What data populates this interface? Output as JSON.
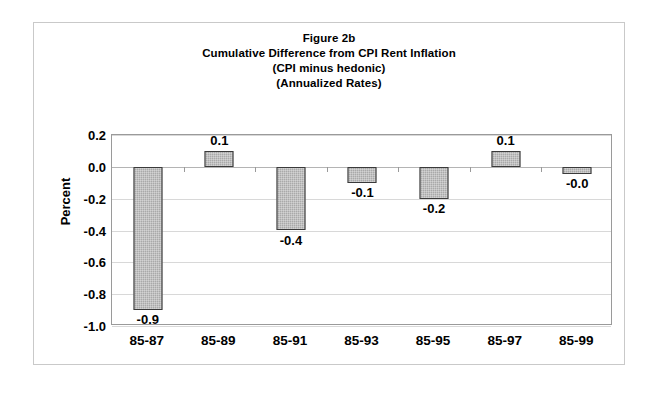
{
  "figure": {
    "title_lines": [
      "Figure 2b",
      "Cumulative Difference from CPI Rent Inflation",
      "(CPI minus hedonic)",
      "(Annualized Rates)"
    ]
  },
  "axes": {
    "y_title": "Percent",
    "y_ticks": [
      "0.2",
      "0.0",
      "-0.2",
      "-0.4",
      "-0.6",
      "-0.8",
      "-1.0"
    ]
  },
  "chart_data": {
    "type": "bar",
    "xlabel": "",
    "ylabel": "Percent",
    "ylim": [
      -1.0,
      0.2
    ],
    "ytick_step": 0.2,
    "grid": true,
    "legend": null,
    "categories": [
      "85-87",
      "85-89",
      "85-91",
      "85-93",
      "85-95",
      "85-97",
      "85-99"
    ],
    "values": [
      -0.9,
      0.1,
      -0.4,
      -0.1,
      -0.2,
      0.1,
      -0.03
    ],
    "data_labels": [
      "-0.9",
      "0.1",
      "-0.4",
      "-0.1",
      "-0.2",
      "0.1",
      "-0.0"
    ],
    "bar_color": "#a9a9a9",
    "bar_border_color": "#3a3a3a"
  }
}
